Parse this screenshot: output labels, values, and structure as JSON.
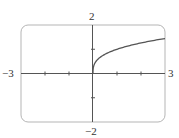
{
  "chart_data": {
    "type": "line",
    "title": "",
    "xlabel": "",
    "ylabel": "",
    "xlim": [
      -3,
      3
    ],
    "ylim": [
      -2,
      2
    ],
    "grid": false,
    "legend": null,
    "x_ticks": [
      -2,
      -1,
      1,
      2
    ],
    "y_ticks": [
      -1,
      1
    ],
    "axis_end_labels": {
      "x_min": "−3",
      "x_max": "3",
      "y_max": "2",
      "y_min": "−2"
    },
    "series": [
      {
        "name": "f(x)",
        "description": "root-shaped curve starting at origin with vertical tangent, increasing for x ≥ 0 (approx. y = ∛x)",
        "x": [
          0,
          0.05,
          0.25,
          0.5,
          1,
          1.5,
          2,
          2.5,
          3
        ],
        "values": [
          0,
          0.37,
          0.63,
          0.79,
          1.0,
          1.14,
          1.26,
          1.36,
          1.44
        ]
      }
    ]
  },
  "colors": {
    "frame": "#b5b5b5",
    "axes": "#555555",
    "curve": "#555555",
    "text": "#333333"
  }
}
